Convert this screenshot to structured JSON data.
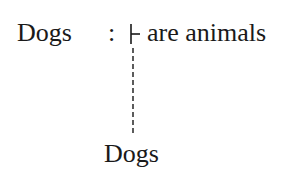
{
  "diagram": {
    "subject": "Dogs",
    "colon": ":",
    "turnstile_icon": "turnstile",
    "predicate": "are animals",
    "connector": "dashed-vertical-line",
    "bottom_label": "Dogs"
  }
}
